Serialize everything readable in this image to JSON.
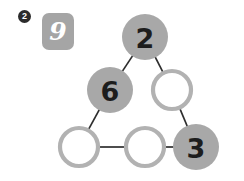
{
  "background_color": "#ffffff",
  "step_badge": {
    "label": "2",
    "icon": "circled-number-badge",
    "color": "#2b2b2b",
    "text_color": "#ffffff"
  },
  "number_tile": {
    "value": "9",
    "color": "#a5a5a5",
    "text_color": "#ffffff"
  },
  "puzzle": {
    "type": "magic-triangle",
    "filled_color": "#a8a8a8",
    "empty_ring_color": "#b2b2b2",
    "edge_color": "#2e2e2e",
    "nodes": [
      {
        "id": "top",
        "value": "2",
        "filled": true,
        "cx": 145,
        "cy": 37,
        "r": 23
      },
      {
        "id": "left-middle",
        "value": "6",
        "filled": true,
        "cx": 110,
        "cy": 90,
        "r": 23
      },
      {
        "id": "right-middle",
        "value": "",
        "filled": false,
        "cx": 172,
        "cy": 90,
        "r": 21
      },
      {
        "id": "bottom-left",
        "value": "",
        "filled": false,
        "cx": 79,
        "cy": 147,
        "r": 21
      },
      {
        "id": "bottom-middle",
        "value": "",
        "filled": false,
        "cx": 145,
        "cy": 147,
        "r": 21
      },
      {
        "id": "bottom-right",
        "value": "3",
        "filled": true,
        "cx": 196,
        "cy": 147,
        "r": 23
      }
    ],
    "edges": [
      {
        "from": "top",
        "to": "left-middle"
      },
      {
        "from": "top",
        "to": "right-middle"
      },
      {
        "from": "left-middle",
        "to": "bottom-left"
      },
      {
        "from": "right-middle",
        "to": "bottom-right"
      },
      {
        "from": "bottom-left",
        "to": "bottom-middle"
      },
      {
        "from": "bottom-middle",
        "to": "bottom-right"
      }
    ]
  }
}
